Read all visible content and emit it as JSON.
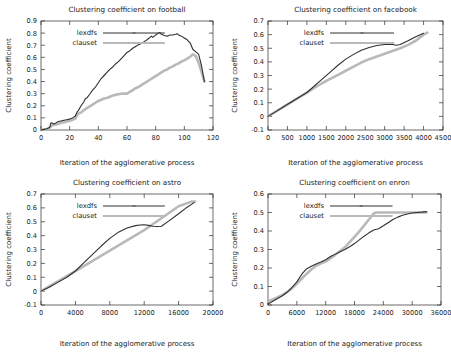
{
  "figure": {
    "panel_count": 4,
    "colors": {
      "lexdfs": "#2f2f2f",
      "clauset": "#b9b9b9",
      "axis": "#2b2b2b",
      "background": "#ffffff"
    }
  },
  "chart_data": [
    {
      "type": "line",
      "id": "football",
      "title": "Clustering coefficient on football",
      "xlabel": "Iteration of the agglomerative process",
      "ylabel": "Clustering coefficient",
      "xlim": [
        0,
        120
      ],
      "ylim": [
        0,
        0.9
      ],
      "xticks": [
        0,
        20,
        40,
        60,
        80,
        100,
        120
      ],
      "xticklabels": [
        "0",
        "20",
        "40",
        "60",
        "80",
        "100",
        "120"
      ],
      "yticks": [
        0,
        0.1,
        0.2,
        0.3,
        0.4,
        0.5,
        0.6,
        0.7,
        0.8,
        0.9
      ],
      "yticklabels": [
        "0",
        "0.1",
        "0.2",
        "0.3",
        "0.4",
        "0.5",
        "0.6",
        "0.7",
        "0.8",
        "0.9"
      ],
      "grid": false,
      "legend_position": "upper-left",
      "series": [
        {
          "name": "lexdfs",
          "color": "#2f2f2f",
          "x": [
            0,
            2,
            4,
            6,
            7,
            8,
            9,
            10,
            12,
            14,
            16,
            18,
            20,
            22,
            24,
            25,
            26,
            28,
            30,
            31,
            32,
            34,
            36,
            38,
            40,
            42,
            44,
            46,
            48,
            50,
            52,
            54,
            56,
            58,
            60,
            62,
            64,
            66,
            68,
            70,
            72,
            74,
            76,
            77,
            78,
            80,
            82,
            83,
            84,
            86,
            88,
            90,
            92,
            94,
            95,
            96,
            98,
            100,
            102,
            104,
            106,
            108,
            110,
            112,
            114
          ],
          "y": [
            0.0,
            0.005,
            0.01,
            0.02,
            0.06,
            0.055,
            0.05,
            0.055,
            0.07,
            0.075,
            0.08,
            0.085,
            0.09,
            0.1,
            0.115,
            0.145,
            0.16,
            0.2,
            0.235,
            0.26,
            0.265,
            0.295,
            0.33,
            0.355,
            0.39,
            0.425,
            0.45,
            0.475,
            0.5,
            0.52,
            0.545,
            0.565,
            0.59,
            0.615,
            0.64,
            0.655,
            0.675,
            0.69,
            0.705,
            0.715,
            0.73,
            0.745,
            0.765,
            0.775,
            0.765,
            0.785,
            0.8,
            0.805,
            0.79,
            0.78,
            0.775,
            0.785,
            0.785,
            0.79,
            0.795,
            0.785,
            0.775,
            0.76,
            0.745,
            0.72,
            0.665,
            0.645,
            0.625,
            0.53,
            0.4
          ]
        },
        {
          "name": "clauset",
          "color": "#b9b9b9",
          "x": [
            0,
            4,
            6,
            8,
            10,
            12,
            14,
            16,
            18,
            20,
            22,
            24,
            25,
            26,
            28,
            30,
            32,
            34,
            36,
            38,
            40,
            42,
            44,
            46,
            48,
            50,
            52,
            54,
            56,
            58,
            60,
            62,
            64,
            66,
            68,
            70,
            72,
            74,
            76,
            78,
            80,
            82,
            84,
            86,
            88,
            90,
            92,
            94,
            96,
            98,
            100,
            102,
            104,
            106,
            108,
            110,
            112,
            114
          ],
          "y": [
            0.0,
            0.005,
            0.02,
            0.04,
            0.045,
            0.05,
            0.06,
            0.065,
            0.07,
            0.075,
            0.085,
            0.095,
            0.12,
            0.135,
            0.145,
            0.165,
            0.18,
            0.195,
            0.21,
            0.225,
            0.24,
            0.25,
            0.26,
            0.265,
            0.275,
            0.285,
            0.29,
            0.295,
            0.3,
            0.3,
            0.3,
            0.315,
            0.33,
            0.345,
            0.355,
            0.37,
            0.385,
            0.4,
            0.415,
            0.43,
            0.445,
            0.46,
            0.475,
            0.49,
            0.5,
            0.515,
            0.525,
            0.54,
            0.55,
            0.565,
            0.575,
            0.59,
            0.605,
            0.625,
            0.61,
            0.555,
            0.48,
            0.4
          ]
        }
      ]
    },
    {
      "type": "line",
      "id": "facebook",
      "title": "Clustering coefficient on facebook",
      "xlabel": "Iteration of the agglomerative process",
      "ylabel": "Clustering coefficient",
      "xlim": [
        0,
        4500
      ],
      "ylim": [
        -0.1,
        0.7
      ],
      "xticks": [
        0,
        500,
        1000,
        1500,
        2000,
        2500,
        3000,
        3500,
        4000,
        4500
      ],
      "xticklabels": [
        "0",
        "500",
        "1000",
        "1500",
        "2000",
        "2500",
        "3000",
        "3500",
        "4000",
        "4500"
      ],
      "yticks": [
        -0.1,
        0,
        0.1,
        0.2,
        0.3,
        0.4,
        0.5,
        0.6,
        0.7
      ],
      "yticklabels": [
        "-0.1",
        "0",
        "0.1",
        "0.2",
        "0.3",
        "0.4",
        "0.5",
        "0.6",
        "0.7"
      ],
      "grid": false,
      "legend_position": "upper-left",
      "series": [
        {
          "name": "lexdfs",
          "color": "#2f2f2f",
          "x": [
            0,
            200,
            400,
            600,
            800,
            1000,
            1200,
            1400,
            1600,
            1800,
            2000,
            2200,
            2400,
            2600,
            2800,
            3000,
            3100,
            3200,
            3300,
            3400,
            3600,
            3800,
            4000
          ],
          "y": [
            0.0,
            0.035,
            0.07,
            0.105,
            0.14,
            0.175,
            0.225,
            0.275,
            0.325,
            0.375,
            0.42,
            0.455,
            0.485,
            0.505,
            0.52,
            0.528,
            0.53,
            0.528,
            0.522,
            0.528,
            0.555,
            0.585,
            0.61
          ]
        },
        {
          "name": "clauset",
          "color": "#b9b9b9",
          "x": [
            0,
            200,
            400,
            600,
            800,
            1000,
            1200,
            1400,
            1600,
            1800,
            2000,
            2200,
            2400,
            2600,
            2800,
            3000,
            3200,
            3400,
            3600,
            3800,
            4000,
            4100
          ],
          "y": [
            0.0,
            0.035,
            0.07,
            0.105,
            0.14,
            0.175,
            0.21,
            0.245,
            0.275,
            0.305,
            0.335,
            0.365,
            0.395,
            0.42,
            0.44,
            0.46,
            0.48,
            0.5,
            0.525,
            0.555,
            0.6,
            0.615
          ]
        }
      ]
    },
    {
      "type": "line",
      "id": "astro",
      "title": "Clustering coefficient on astro",
      "xlabel": "Iteration of the agglomerative process",
      "ylabel": "Clustering coefficient",
      "xlim": [
        0,
        20000
      ],
      "ylim": [
        -0.1,
        0.7
      ],
      "xticks": [
        0,
        4000,
        8000,
        12000,
        16000,
        20000
      ],
      "xticklabels": [
        "0",
        "4000",
        "8000",
        "12000",
        "16000",
        "20000"
      ],
      "yticks": [
        -0.1,
        0,
        0.1,
        0.2,
        0.3,
        0.4,
        0.5,
        0.6,
        0.7
      ],
      "yticklabels": [
        "-0.1",
        "0",
        "0.1",
        "0.2",
        "0.3",
        "0.4",
        "0.5",
        "0.6",
        "0.7"
      ],
      "grid": false,
      "legend_position": "upper-left",
      "series": [
        {
          "name": "lexdfs",
          "color": "#2f2f2f",
          "x": [
            0,
            1000,
            2000,
            3000,
            4000,
            5000,
            6000,
            7000,
            8000,
            9000,
            10000,
            11000,
            11500,
            12000,
            12500,
            13000,
            13500,
            14000,
            15000,
            16000,
            17000,
            17800
          ],
          "y": [
            0.0,
            0.03,
            0.065,
            0.1,
            0.145,
            0.205,
            0.265,
            0.325,
            0.38,
            0.425,
            0.455,
            0.472,
            0.477,
            0.478,
            0.474,
            0.468,
            0.466,
            0.468,
            0.512,
            0.558,
            0.605,
            0.638
          ]
        },
        {
          "name": "clauset",
          "color": "#b9b9b9",
          "x": [
            0,
            2000,
            4000,
            6000,
            8000,
            10000,
            12000,
            14000,
            16000,
            17500,
            17900
          ],
          "y": [
            0.0,
            0.072,
            0.145,
            0.218,
            0.292,
            0.365,
            0.44,
            0.525,
            0.612,
            0.645,
            0.645
          ]
        }
      ]
    },
    {
      "type": "line",
      "id": "enron",
      "title": "Clustering coefficient on enron",
      "xlabel": "Iteration of the agglomerative process",
      "ylabel": "Clustering coefficient",
      "xlim": [
        0,
        36000
      ],
      "ylim": [
        0,
        0.6
      ],
      "xticks": [
        0,
        6000,
        12000,
        18000,
        24000,
        30000,
        36000
      ],
      "xticklabels": [
        "0",
        "6000",
        "12000",
        "18000",
        "24000",
        "30000",
        "36000"
      ],
      "yticks": [
        0,
        0.1,
        0.2,
        0.3,
        0.4,
        0.5,
        0.6
      ],
      "yticklabels": [
        "0",
        "0.1",
        "0.2",
        "0.3",
        "0.4",
        "0.5",
        "0.6"
      ],
      "grid": false,
      "legend_position": "upper-left",
      "series": [
        {
          "name": "lexdfs",
          "color": "#2f2f2f",
          "x": [
            0,
            1000,
            2000,
            3000,
            4000,
            5000,
            6000,
            7000,
            8000,
            9000,
            10000,
            11000,
            12000,
            13000,
            14000,
            15000,
            16000,
            17000,
            18000,
            19000,
            20000,
            21000,
            22000,
            23000,
            24000,
            25000,
            26000,
            27000,
            28000,
            29000,
            30000,
            31000,
            32000,
            33000
          ],
          "y": [
            0.005,
            0.02,
            0.035,
            0.05,
            0.07,
            0.095,
            0.125,
            0.165,
            0.195,
            0.21,
            0.222,
            0.232,
            0.245,
            0.262,
            0.275,
            0.288,
            0.3,
            0.315,
            0.332,
            0.352,
            0.372,
            0.39,
            0.405,
            0.412,
            0.428,
            0.445,
            0.462,
            0.475,
            0.485,
            0.492,
            0.497,
            0.5,
            0.502,
            0.505
          ]
        },
        {
          "name": "clauset",
          "color": "#b9b9b9",
          "x": [
            0,
            1000,
            2000,
            3000,
            4000,
            5000,
            6000,
            7000,
            8000,
            9000,
            10000,
            11000,
            12000,
            13000,
            14000,
            15000,
            16000,
            17000,
            18000,
            19000,
            20000,
            21000,
            22000,
            22500,
            24000,
            27000,
            30000,
            33000
          ],
          "y": [
            0.02,
            0.03,
            0.042,
            0.055,
            0.07,
            0.09,
            0.115,
            0.142,
            0.168,
            0.192,
            0.212,
            0.225,
            0.235,
            0.252,
            0.272,
            0.292,
            0.312,
            0.34,
            0.368,
            0.398,
            0.43,
            0.462,
            0.495,
            0.5,
            0.5,
            0.5,
            0.5,
            0.5
          ]
        }
      ]
    }
  ],
  "legend": {
    "entries": [
      {
        "label": "lexdfs",
        "color": "#2f2f2f"
      },
      {
        "label": "clauset",
        "color": "#b9b9b9"
      }
    ]
  }
}
